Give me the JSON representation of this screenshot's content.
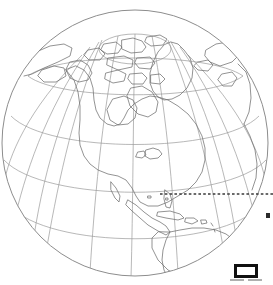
{
  "figure": {
    "type": "orthographic-globe",
    "background_color": "#ffffff",
    "globe": {
      "center_x": 135,
      "center_y": 143,
      "radius": 133,
      "outline_color": "#8d8d8d",
      "fill_color": "#ffffff",
      "graticule_color": "#9a9a9a",
      "coastline_color": "#6f6f6f",
      "projection_center_label": "North America / North Pole",
      "graticule_spacing_degrees": 20
    },
    "annotation": {
      "dotted_line": {
        "name": "latitude-reference-line",
        "color": "#3a3a3a",
        "y": 194,
        "x_start": 160,
        "x_end": 273,
        "style": "dotted"
      },
      "marker_dot": {
        "name": "reference-point-marker",
        "color": "#2b2b2b",
        "x": 268,
        "y": 215
      }
    },
    "legend_icon": {
      "name": "monitor-icon",
      "border_color": "#101010",
      "screen_color": "#ffffff",
      "base_color": "#9b9b9b",
      "x": 234,
      "y": 264,
      "width": 24,
      "height": 14
    }
  },
  "chart_data": {
    "type": "map",
    "title": "",
    "subtitle": "",
    "xlabel": "",
    "ylabel": "",
    "projection": "orthographic",
    "center_lon": -80,
    "center_lat": 45,
    "grid": true,
    "legend_position": "bottom-right",
    "annotations": [
      {
        "label": "",
        "kind": "horizontal-dotted-line",
        "y_px": 194
      },
      {
        "label": "",
        "kind": "point-marker",
        "x_px": 268,
        "y_px": 215
      },
      {
        "label": "",
        "kind": "monitor-glyph",
        "x_px": 234,
        "y_px": 264
      }
    ],
    "features": [
      "north-america",
      "greenland",
      "canadian-arctic-archipelago",
      "hudson-bay",
      "great-lakes",
      "central-america",
      "caribbean-islands",
      "south-america-north",
      "western-europe-edge",
      "northwest-africa-edge",
      "siberia-edge",
      "alaska"
    ]
  }
}
